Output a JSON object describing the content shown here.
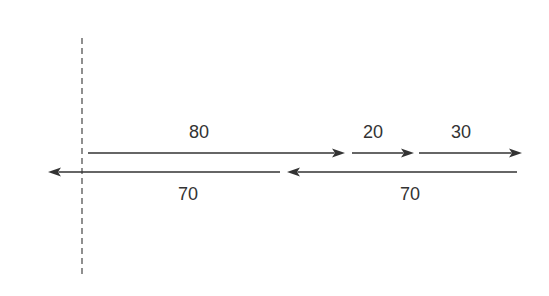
{
  "diagram": {
    "type": "vector-arrow-diagram",
    "colors": {
      "line": "#333333",
      "dashed": "#555555",
      "background": "#ffffff"
    },
    "reference_line": {
      "x": 82,
      "y1": 38,
      "y2": 278,
      "style": "dashed"
    },
    "upper_arrows": [
      {
        "label": "80",
        "x1": 88,
        "x2": 345,
        "y": 153,
        "direction": "right",
        "label_x": 199,
        "label_y": 123
      },
      {
        "label": "20",
        "x1": 352,
        "x2": 414,
        "y": 153,
        "direction": "right",
        "label_x": 373,
        "label_y": 123
      },
      {
        "label": "30",
        "x1": 419,
        "x2": 522,
        "y": 153,
        "direction": "right",
        "label_x": 461,
        "label_y": 123
      }
    ],
    "lower_arrows": [
      {
        "label": "70",
        "x1": 280,
        "x2": 48,
        "y": 172,
        "direction": "left",
        "label_x": 188,
        "label_y": 185
      },
      {
        "label": "70",
        "x1": 517,
        "x2": 287,
        "y": 172,
        "direction": "left",
        "label_x": 410,
        "label_y": 185
      }
    ]
  }
}
